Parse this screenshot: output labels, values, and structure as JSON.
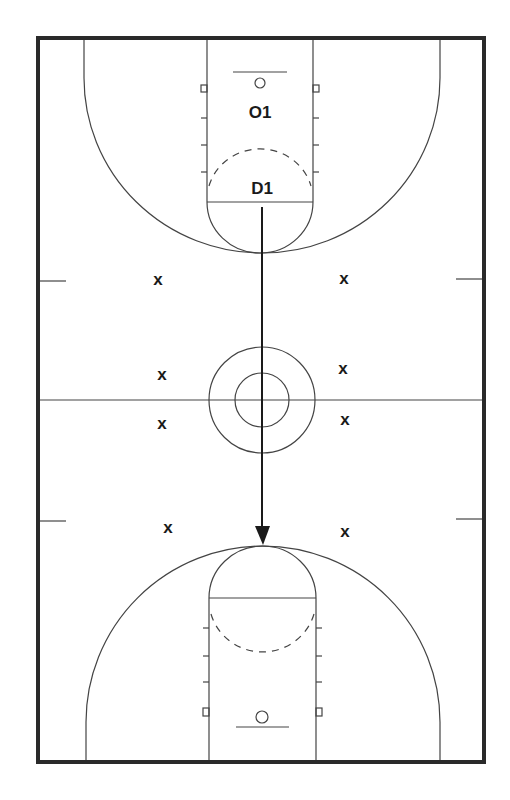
{
  "diagram": {
    "type": "basketball-full-court",
    "colors": {
      "line": "#444444",
      "border": "#2a2a2a",
      "marker": "#1a1a1a",
      "background": "#ffffff"
    },
    "players": [
      {
        "id": "offense-1",
        "label": "O1",
        "x": 260,
        "y": 118
      },
      {
        "id": "defense-1",
        "label": "D1",
        "x": 262,
        "y": 194
      }
    ],
    "markers": [
      {
        "label": "x",
        "x": 158,
        "y": 285
      },
      {
        "label": "x",
        "x": 344,
        "y": 284
      },
      {
        "label": "x",
        "x": 162,
        "y": 380
      },
      {
        "label": "x",
        "x": 343,
        "y": 374
      },
      {
        "label": "x",
        "x": 162,
        "y": 429
      },
      {
        "label": "x",
        "x": 345,
        "y": 425
      },
      {
        "label": "x",
        "x": 168,
        "y": 533
      },
      {
        "label": "x",
        "x": 345,
        "y": 537
      }
    ],
    "movement": {
      "from_player": "D1",
      "start": [
        262,
        207
      ],
      "end": [
        262,
        545
      ],
      "style": "solid-arrow"
    }
  }
}
